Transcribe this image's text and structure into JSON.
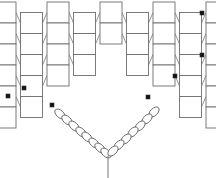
{
  "figure": {
    "background_color": "#ffffff",
    "width": 216,
    "height": 178
  },
  "style": {
    "cell_stroke": "#6e6e6e",
    "cell_stroke_width": 0.9,
    "cell_fill": "#ffffff",
    "connector_stroke": "#8a8a8a",
    "connector_stroke_width": 0.9,
    "marker_fill": "#111111",
    "marker_ring_stroke": "#333333",
    "bead_stroke": "#666666",
    "bead_fill": "#ffffff",
    "chain_stroke": "#777777",
    "stem_stroke": "#777777"
  },
  "lattice": {
    "description": "Offset brick / plain-weave grid of rectangular cells forming an inverted triangular panel",
    "cell_width": 22,
    "cell_height": 21,
    "column_pitch": 26.5,
    "row_pitch": 21,
    "origin_x": -6,
    "origin_y": 2,
    "columns": 9,
    "rows": 6,
    "offset_pattern": "alternate columns shifted down by half a row",
    "column_offsets": [
      0,
      10.5,
      0,
      10.5,
      0,
      10.5,
      0,
      10.5,
      0
    ],
    "column_row_counts": [
      5,
      5,
      5,
      5,
      5,
      5,
      5,
      5,
      5
    ],
    "triangular_cut": true,
    "cut_note": "lower-right and lower-left cells removed so the bottom edge steps down toward the centre"
  },
  "markers": {
    "name": "dot-cells",
    "description": "Cells containing a small solid square dot marker",
    "glyph": "filled-square-dot",
    "positions": [
      {
        "id": "m1",
        "x": 202,
        "y": 13
      },
      {
        "id": "m2",
        "x": 202,
        "y": 55
      },
      {
        "id": "m3",
        "x": 175,
        "y": 76
      },
      {
        "id": "m4",
        "x": 148,
        "y": 97
      },
      {
        "id": "m5",
        "x": 24,
        "y": 88
      },
      {
        "id": "m6",
        "x": 52,
        "y": 105
      },
      {
        "id": "m7",
        "x": 8,
        "y": 96
      }
    ]
  },
  "chain": {
    "name": "v-pendant-chain",
    "description": "Two diagonal strands of oval beads meeting at a lower centre vertex, with a short vertical stem below",
    "apex": {
      "x": 108,
      "y": 156
    },
    "left_anchor": {
      "x": 56,
      "y": 110
    },
    "right_anchor": {
      "x": 158,
      "y": 108
    },
    "stem": {
      "x": 108,
      "y_top": 156,
      "y_bottom": 178
    },
    "bead_rx": 6.2,
    "bead_ry": 3.6,
    "left_bead_count": 8,
    "right_bead_count": 7,
    "left_beads": [
      {
        "x": 60,
        "y": 114
      },
      {
        "x": 67,
        "y": 120
      },
      {
        "x": 74,
        "y": 126
      },
      {
        "x": 81,
        "y": 132
      },
      {
        "x": 87,
        "y": 137
      },
      {
        "x": 94,
        "y": 143
      },
      {
        "x": 100,
        "y": 148
      },
      {
        "x": 106,
        "y": 153
      }
    ],
    "right_beads": [
      {
        "x": 154,
        "y": 112
      },
      {
        "x": 147,
        "y": 119
      },
      {
        "x": 140,
        "y": 126
      },
      {
        "x": 133,
        "y": 132
      },
      {
        "x": 126,
        "y": 139
      },
      {
        "x": 119,
        "y": 145
      },
      {
        "x": 113,
        "y": 151
      }
    ]
  },
  "connectors": {
    "name": "horizontal-weave-links",
    "description": "Short horizontal segments linking adjacent cell columns at each row",
    "count": 48
  }
}
